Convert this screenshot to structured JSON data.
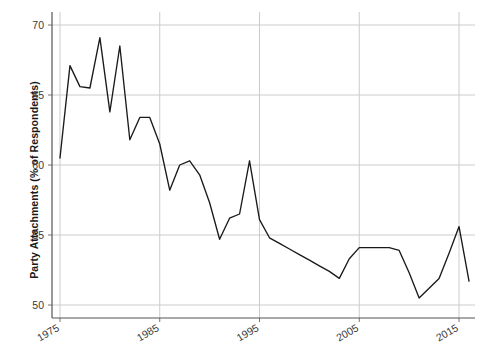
{
  "chart_data": {
    "type": "line",
    "title": "",
    "subtitle": "",
    "xlabel": "",
    "ylabel": "Party Attachments (% of Respondents)",
    "xlim": [
      1975,
      1967
    ],
    "x_axis_range": [
      1974.2,
      2016.6
    ],
    "ylim": [
      48.8,
      70.8
    ],
    "y_axis_range": [
      48.8,
      70.8
    ],
    "grid": true,
    "legend": false,
    "legend_position": "none",
    "xticks": [
      1975,
      1985,
      1995,
      2005,
      2015
    ],
    "xtick_labels": [
      "1975",
      "1985",
      "1995",
      "2005",
      "2015"
    ],
    "xtick_rotation": 30,
    "yticks": [
      50,
      55,
      60,
      65,
      70
    ],
    "ytick_labels": [
      "50",
      "55",
      "60",
      "65",
      "70"
    ],
    "line_color": "#1a1a1a",
    "grid_color": "#cccccc",
    "axis_color": "#555555",
    "background_color": "#ffffff",
    "series": [
      {
        "name": "Party Attachments",
        "x": [
          1975,
          1976,
          1977,
          1978,
          1979,
          1980,
          1981,
          1982,
          1983,
          1984,
          1985,
          1986,
          1987,
          1988,
          1989,
          1990,
          1991,
          1992,
          1993,
          1994,
          1995,
          1996,
          1997,
          1998,
          1999,
          2000,
          2001,
          2002,
          2003,
          2004,
          2005,
          2006,
          2007,
          2008,
          2009,
          2010,
          2011,
          2012,
          2013,
          2014,
          2015,
          2016
        ],
        "values": [
          60.5,
          67.1,
          65.6,
          65.5,
          69.1,
          63.8,
          68.5,
          61.8,
          63.4,
          63.4,
          61.5,
          58.2,
          60.0,
          60.3,
          59.3,
          57.3,
          54.7,
          56.2,
          56.5,
          60.3,
          56.1,
          54.8,
          54.4,
          54.0,
          53.6,
          53.2,
          52.8,
          52.4,
          51.9,
          53.3,
          54.1,
          54.1,
          54.1,
          54.1,
          53.9,
          52.3,
          50.5,
          51.2,
          51.9,
          53.7,
          55.6,
          51.7
        ]
      }
    ]
  },
  "axes": {
    "ylabel_text": "Party Attachments (% of Respondents)"
  }
}
